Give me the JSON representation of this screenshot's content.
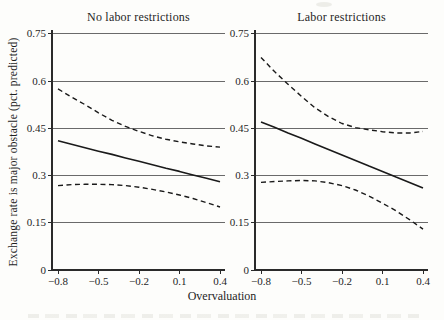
{
  "figure": {
    "xlabel": "Overvaluation",
    "ylabel": "Exchange rate is major obstacle (pct. predicted)"
  },
  "colors": {
    "line": "#1a1a1a",
    "grid": "#5a5a5a",
    "axis": "#2a2a2a",
    "text": "#1f1f1f",
    "background": "#fdfdfb"
  },
  "chart_data": [
    {
      "type": "line",
      "title": "No labor restrictions",
      "xlabel": "Overvaluation",
      "ylabel": "Exchange rate is major obstacle (pct. predicted)",
      "xlim": [
        -0.85,
        0.45
      ],
      "ylim": [
        0,
        0.78
      ],
      "grid": "horizontal",
      "legend": "none",
      "xticks": {
        "values": [
          -0.8,
          -0.5,
          -0.2,
          0.1,
          0.4
        ],
        "labels": [
          "−0.8",
          "−0.5",
          "−0.2",
          "0.1",
          "0.4"
        ]
      },
      "yticks": {
        "values": [
          0,
          0.15,
          0.3,
          0.45,
          0.6,
          0.75
        ],
        "labels": [
          "0",
          "0.15",
          "0.3",
          "0.45",
          "0.6",
          "0.75"
        ]
      },
      "x": [
        -0.8,
        -0.7,
        -0.6,
        -0.5,
        -0.4,
        -0.3,
        -0.2,
        -0.1,
        0,
        0.1,
        0.2,
        0.3,
        0.4
      ],
      "series": [
        {
          "name": "upper dashed band",
          "style": "dashed",
          "values": [
            0.575,
            0.549,
            0.525,
            0.499,
            0.475,
            0.456,
            0.44,
            0.426,
            0.415,
            0.407,
            0.4,
            0.394,
            0.39
          ]
        },
        {
          "name": "solid point estimate",
          "style": "solid",
          "values": [
            0.41,
            0.399,
            0.388,
            0.377,
            0.367,
            0.356,
            0.345,
            0.334,
            0.323,
            0.313,
            0.302,
            0.291,
            0.28
          ]
        },
        {
          "name": "lower dashed band",
          "style": "dashed",
          "values": [
            0.268,
            0.271,
            0.272,
            0.272,
            0.271,
            0.268,
            0.263,
            0.256,
            0.248,
            0.238,
            0.227,
            0.214,
            0.2
          ]
        }
      ]
    },
    {
      "type": "line",
      "title": "Labor restrictions",
      "xlabel": "Overvaluation",
      "ylabel": "Exchange rate is major obstacle (pct. predicted)",
      "xlim": [
        -0.85,
        0.45
      ],
      "ylim": [
        0,
        0.78
      ],
      "grid": "horizontal",
      "legend": "none",
      "xticks": {
        "values": [
          -0.8,
          -0.5,
          -0.2,
          0.1,
          0.4
        ],
        "labels": [
          "−0.8",
          "−0.5",
          "−0.2",
          "0.1",
          "0.4"
        ]
      },
      "yticks": {
        "values": [
          0,
          0.15,
          0.3,
          0.45,
          0.6,
          0.75
        ],
        "labels": [
          "0",
          "0.15",
          "0.3",
          "0.45",
          "0.6",
          "0.75"
        ]
      },
      "x": [
        -0.8,
        -0.7,
        -0.6,
        -0.5,
        -0.4,
        -0.3,
        -0.2,
        -0.1,
        0,
        0.1,
        0.2,
        0.3,
        0.4
      ],
      "series": [
        {
          "name": "upper dashed band",
          "style": "dashed",
          "values": [
            0.675,
            0.63,
            0.59,
            0.551,
            0.515,
            0.487,
            0.465,
            0.452,
            0.445,
            0.439,
            0.435,
            0.435,
            0.44
          ]
        },
        {
          "name": "solid point estimate",
          "style": "solid",
          "values": [
            0.47,
            0.453,
            0.435,
            0.418,
            0.4,
            0.383,
            0.365,
            0.348,
            0.33,
            0.313,
            0.295,
            0.278,
            0.26
          ]
        },
        {
          "name": "lower dashed band",
          "style": "dashed",
          "values": [
            0.278,
            0.281,
            0.283,
            0.284,
            0.283,
            0.277,
            0.268,
            0.254,
            0.235,
            0.212,
            0.188,
            0.16,
            0.13
          ]
        }
      ]
    }
  ]
}
